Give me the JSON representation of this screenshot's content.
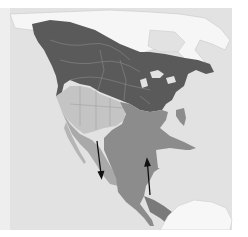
{
  "map": {
    "region": "North America",
    "style": "greyscale range map",
    "colors": {
      "page_bg": "#ffffff",
      "ocean": "#e2e2e2",
      "land_outside": "#f4f4f4",
      "range_north": "#5a5a5a",
      "range_southwest_light": "#c4c4c4",
      "range_southwest_mid": "#a9a9a9",
      "range_south": "#8c8c8c",
      "borders": "#b8b8b8",
      "arrows": "#111111"
    },
    "legend": [],
    "arrows": [
      {
        "id": "arrow-west",
        "direction": "down",
        "from": [
          97,
          141
        ],
        "to": [
          101,
          177
        ]
      },
      {
        "id": "arrow-east",
        "direction": "up",
        "from": [
          150,
          195
        ],
        "to": [
          147,
          160
        ]
      }
    ]
  }
}
